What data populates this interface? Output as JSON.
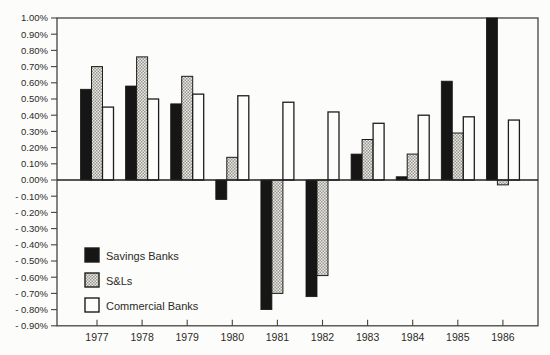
{
  "chart_data": {
    "type": "bar",
    "title": "",
    "categories": [
      "1977",
      "1978",
      "1979",
      "1980",
      "1981",
      "1982",
      "1983",
      "1984",
      "1985",
      "1986"
    ],
    "series": [
      {
        "name": "Savings Banks",
        "fill": "black",
        "values": [
          0.56,
          0.58,
          0.47,
          -0.12,
          -0.8,
          -0.72,
          0.16,
          0.02,
          0.61,
          1.0
        ]
      },
      {
        "name": "S&Ls",
        "fill": "halftone",
        "values": [
          0.7,
          0.76,
          0.64,
          0.14,
          -0.7,
          -0.59,
          0.25,
          0.16,
          0.29,
          -0.03
        ]
      },
      {
        "name": "Commercial Banks",
        "fill": "white",
        "values": [
          0.45,
          0.5,
          0.53,
          0.52,
          0.48,
          0.42,
          0.35,
          0.4,
          0.39,
          0.37
        ]
      }
    ],
    "ylim": [
      -0.9,
      1.0
    ],
    "y_tick_step": 0.1,
    "y_tick_labels": [
      "1.00%",
      "0.90%",
      "0.80%",
      "0.70%",
      "0.60%",
      "0.50%",
      "0.40%",
      "0.30%",
      "0.20%",
      "0.10%",
      "0.00%",
      "- 0.10%",
      "- 0.20%",
      "- 0.30%",
      "- 0.40%",
      "- 0.50%",
      "- 0.60%",
      "- 0.70%",
      "- 0.80%",
      "- 0.90%"
    ],
    "xlabel": "",
    "ylabel": "",
    "grid": false,
    "legend_position": "inside-bottom-left",
    "colors": {
      "bar_black": "#161616",
      "bar_white": "#fdfdfc",
      "bar_outline": "#1d1d1b",
      "halftone_dark": "#96968f",
      "halftone_light": "#eceae6",
      "axis": "#45443f",
      "text": "#2b2b28",
      "background": "#fcfcfa"
    }
  }
}
